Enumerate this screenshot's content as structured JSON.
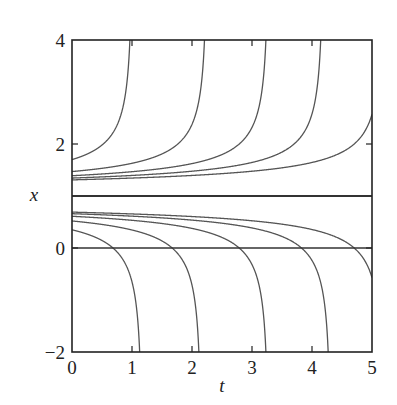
{
  "chart_data": {
    "type": "line",
    "title": "",
    "xlabel": "t",
    "ylabel": "x",
    "xlim": [
      0,
      5
    ],
    "ylim": [
      -2,
      4
    ],
    "grid": false,
    "legend": null,
    "x_ticks": [
      0,
      1,
      2,
      3,
      4,
      5
    ],
    "x_tick_labels": [
      "0",
      "1",
      "2",
      "3",
      "4",
      "5"
    ],
    "y_ticks": [
      -2,
      0,
      2,
      4
    ],
    "y_tick_labels": [
      "−2",
      "0",
      "2",
      "4"
    ],
    "equilibrium_lines": [
      {
        "name": "x = 1 (equilibrium)",
        "y": 1,
        "width": 2.2
      },
      {
        "name": "x = 0 (t-axis)",
        "y": 0,
        "width": 1.6
      }
    ],
    "solution_curves": {
      "description": "Family of solution curves diverging from the equilibrium x = 1",
      "model": "x(t) = 1 ± d0 / sqrt(1 - 2 d0^2 t)",
      "upper_initial_values": [
        1.7,
        1.47,
        1.39,
        1.345,
        1.31
      ],
      "lower_initial_values": [
        0.35,
        0.52,
        0.61,
        0.66,
        0.69
      ],
      "upper_blowup_t_at_x4": [
        1.08,
        2.18,
        3.25,
        4.18,
        null
      ],
      "lower_blowup_t_at_xm2": [
        1.12,
        2.1,
        3.17,
        4.28,
        null
      ],
      "upper_value_at_t5": [
        null,
        null,
        null,
        null,
        2.5
      ],
      "lower_value_at_t5": [
        null,
        null,
        null,
        null,
        -0.37
      ]
    },
    "colors": {
      "frame": "#222222",
      "curves": "#555555",
      "equilibrium": "#333333"
    }
  }
}
